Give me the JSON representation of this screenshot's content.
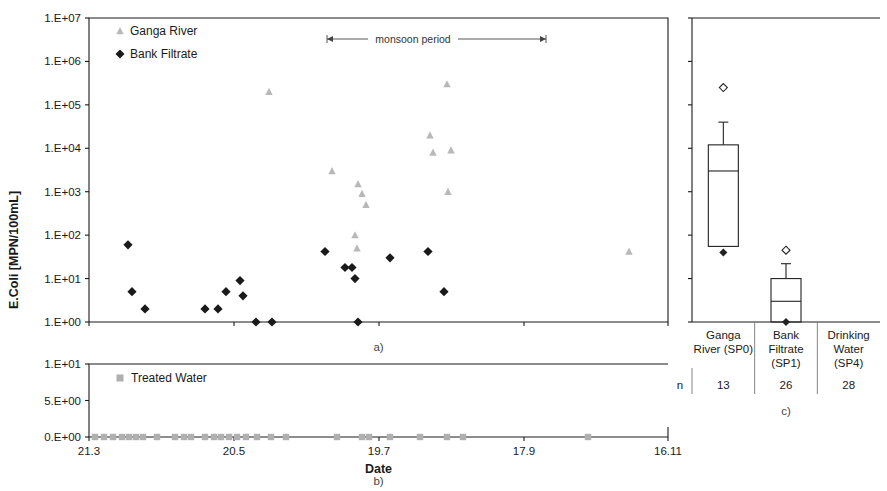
{
  "figure": {
    "y_axis_title": "E.Coli  [MPN/100mL]",
    "x_axis_title": "Date",
    "captions": {
      "a": "a)",
      "b": "b)",
      "c": "c)"
    }
  },
  "panel_a": {
    "legend": [
      {
        "key": "ganga",
        "label": "Ganga River",
        "marker": "triangle",
        "color": "#b8b8b8"
      },
      {
        "key": "bank",
        "label": "Bank Filtrate",
        "marker": "diamond",
        "color": "#1a1a1a"
      }
    ],
    "annotation": {
      "label": "monsoon period",
      "start_date_px": 327,
      "end_date_px": 546
    },
    "y_ticks": [
      "1.E+00",
      "1.E+01",
      "1.E+02",
      "1.E+03",
      "1.E+04",
      "1.E+05",
      "1.E+06",
      "1.E+07"
    ],
    "x_ticks": [
      "21.3",
      "20.5",
      "19.7",
      "17.9",
      "16.11"
    ]
  },
  "panel_b": {
    "legend": [
      {
        "key": "treated",
        "label": "Treated Water",
        "marker": "square",
        "color": "#b0b0b0"
      }
    ],
    "y_ticks": [
      "0.E+00",
      "5.E+00",
      "1.E+01"
    ],
    "x_ticks": [
      "21.3",
      "20.5",
      "19.7",
      "17.9",
      "16.11"
    ]
  },
  "panel_c": {
    "n_row_label": "n",
    "categories": [
      {
        "label_lines": [
          "Ganga",
          "River (SP0)"
        ],
        "n": "13"
      },
      {
        "label_lines": [
          "Bank",
          "Filtrate",
          "(SP1)"
        ],
        "n": "26"
      },
      {
        "label_lines": [
          "Drinking",
          "Water",
          "(SP4)"
        ],
        "n": "28"
      }
    ]
  },
  "chart_data": {
    "type": "scatter",
    "title": "",
    "xlabel": "Date",
    "ylabel": "E.Coli  [MPN/100mL]",
    "panels": [
      {
        "id": "a",
        "type": "scatter",
        "yscale": "log",
        "ylim": [
          1,
          10000000
        ],
        "ytick_values": [
          1,
          10,
          100,
          1000,
          10000,
          100000,
          1000000,
          10000000
        ],
        "ytick_labels": [
          "1.E+00",
          "1.E+01",
          "1.E+02",
          "1.E+03",
          "1.E+04",
          "1.E+05",
          "1.E+06",
          "1.E+07"
        ],
        "xtick_labels": [
          "21.3",
          "20.5",
          "19.7",
          "17.9",
          "16.11"
        ],
        "xtick_px": [
          89,
          234,
          379,
          524,
          668
        ],
        "grid": false,
        "series": [
          {
            "name": "Ganga River",
            "marker": "triangle",
            "color": "#b8b8b8",
            "points": [
              {
                "x_px": 269,
                "y": 200000
              },
              {
                "x_px": 332,
                "y": 3000
              },
              {
                "x_px": 355,
                "y": 100
              },
              {
                "x_px": 357,
                "y": 50
              },
              {
                "x_px": 358,
                "y": 1500
              },
              {
                "x_px": 362,
                "y": 900
              },
              {
                "x_px": 366,
                "y": 500
              },
              {
                "x_px": 430,
                "y": 20000
              },
              {
                "x_px": 433,
                "y": 8000
              },
              {
                "x_px": 447,
                "y": 300000
              },
              {
                "x_px": 448,
                "y": 1000
              },
              {
                "x_px": 451,
                "y": 9000
              },
              {
                "x_px": 629,
                "y": 42
              }
            ]
          },
          {
            "name": "Bank Filtrate",
            "marker": "diamond",
            "color": "#1a1a1a",
            "points": [
              {
                "x_px": 128,
                "y": 60
              },
              {
                "x_px": 132,
                "y": 5
              },
              {
                "x_px": 145,
                "y": 2
              },
              {
                "x_px": 205,
                "y": 2
              },
              {
                "x_px": 218,
                "y": 2
              },
              {
                "x_px": 226,
                "y": 5
              },
              {
                "x_px": 240,
                "y": 9
              },
              {
                "x_px": 243,
                "y": 4
              },
              {
                "x_px": 256,
                "y": 1
              },
              {
                "x_px": 272,
                "y": 1
              },
              {
                "x_px": 325,
                "y": 42
              },
              {
                "x_px": 345,
                "y": 18
              },
              {
                "x_px": 352,
                "y": 18
              },
              {
                "x_px": 355,
                "y": 10
              },
              {
                "x_px": 358,
                "y": 1
              },
              {
                "x_px": 390,
                "y": 30
              },
              {
                "x_px": 428,
                "y": 42
              },
              {
                "x_px": 444,
                "y": 5
              }
            ]
          }
        ],
        "annotation": {
          "text": "monsoon period",
          "x_start_px": 327,
          "x_end_px": 546
        }
      },
      {
        "id": "b",
        "type": "scatter",
        "yscale": "linear",
        "ylim": [
          0,
          10
        ],
        "ytick_values": [
          0,
          5,
          10
        ],
        "ytick_labels": [
          "0.E+00",
          "5.E+00",
          "1.E+01"
        ],
        "xtick_labels": [
          "21.3",
          "20.5",
          "19.7",
          "17.9",
          "16.11"
        ],
        "grid": false,
        "series": [
          {
            "name": "Treated Water",
            "marker": "square",
            "color": "#b0b0b0",
            "points": [
              {
                "x_px": 95,
                "y": 0
              },
              {
                "x_px": 104,
                "y": 0
              },
              {
                "x_px": 113,
                "y": 0
              },
              {
                "x_px": 122,
                "y": 0
              },
              {
                "x_px": 129,
                "y": 0
              },
              {
                "x_px": 136,
                "y": 0
              },
              {
                "x_px": 143,
                "y": 0
              },
              {
                "x_px": 157,
                "y": 0
              },
              {
                "x_px": 175,
                "y": 0
              },
              {
                "x_px": 184,
                "y": 0
              },
              {
                "x_px": 191,
                "y": 0
              },
              {
                "x_px": 205,
                "y": 0
              },
              {
                "x_px": 214,
                "y": 0
              },
              {
                "x_px": 221,
                "y": 0
              },
              {
                "x_px": 229,
                "y": 0
              },
              {
                "x_px": 237,
                "y": 0
              },
              {
                "x_px": 246,
                "y": 0
              },
              {
                "x_px": 257,
                "y": 0
              },
              {
                "x_px": 271,
                "y": 0
              },
              {
                "x_px": 286,
                "y": 0
              },
              {
                "x_px": 337,
                "y": 0
              },
              {
                "x_px": 362,
                "y": 0
              },
              {
                "x_px": 369,
                "y": 0
              },
              {
                "x_px": 390,
                "y": 0
              },
              {
                "x_px": 420,
                "y": 0
              },
              {
                "x_px": 447,
                "y": 0
              },
              {
                "x_px": 463,
                "y": 0
              },
              {
                "x_px": 588,
                "y": 0
              }
            ]
          }
        ]
      },
      {
        "id": "c",
        "type": "boxplot",
        "yscale": "log",
        "ylim": [
          1,
          10000000
        ],
        "categories": [
          "Ganga River (SP0)",
          "Bank Filtrate (SP1)",
          "Drinking Water (SP4)"
        ],
        "n": [
          13,
          26,
          28
        ],
        "boxes": [
          {
            "category": "Ganga River (SP0)",
            "whisker_high": 40000,
            "q3": 12000,
            "median": 3000,
            "q1": 55,
            "whisker_low": 40,
            "outliers_high": [
              250000
            ]
          },
          {
            "category": "Bank Filtrate (SP1)",
            "whisker_high": 22,
            "q3": 10,
            "median": 3,
            "q1": 1,
            "whisker_low": 1,
            "outliers_high": [
              45
            ]
          },
          {
            "category": "Drinking Water (SP4)",
            "whisker_high": 1,
            "q3": 1,
            "median": 1,
            "q1": 1,
            "whisker_low": 1,
            "outliers_high": []
          }
        ]
      }
    ]
  }
}
